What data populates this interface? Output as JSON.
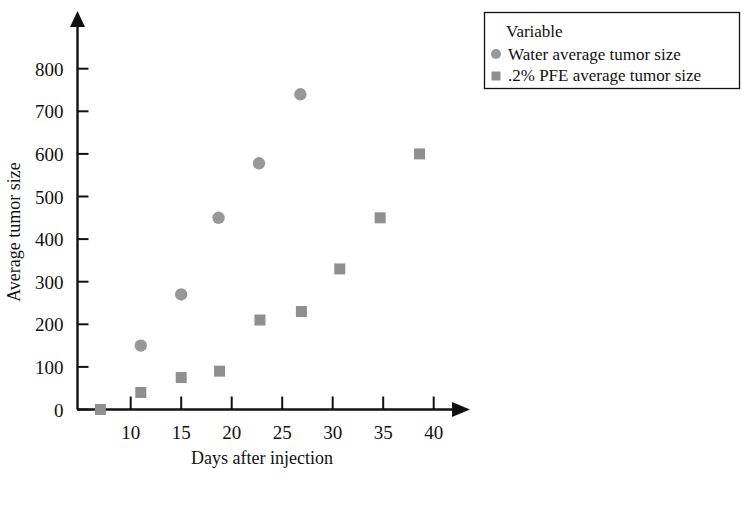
{
  "chart_data": {
    "type": "scatter",
    "title": "",
    "xlabel": "Days after injection",
    "ylabel": "Average tumor size",
    "xlim": [
      5,
      45
    ],
    "ylim": [
      0,
      800
    ],
    "xticks": [
      10,
      15,
      20,
      25,
      30,
      35,
      40
    ],
    "yticks": [
      0,
      100,
      200,
      300,
      400,
      500,
      600,
      700,
      800
    ],
    "grid": false,
    "legend_position": "top-right",
    "legend_title": "Variable",
    "series": [
      {
        "name": "Water average tumor size",
        "marker": "circle",
        "color": "#989898",
        "points": [
          {
            "x": 11,
            "y": 150
          },
          {
            "x": 15,
            "y": 270
          },
          {
            "x": 18.7,
            "y": 450
          },
          {
            "x": 22.7,
            "y": 578
          },
          {
            "x": 26.8,
            "y": 740
          }
        ]
      },
      {
        "name": ".2% PFE average tumor size",
        "marker": "square",
        "color": "#8f8f8f",
        "points": [
          {
            "x": 7,
            "y": 0
          },
          {
            "x": 11,
            "y": 40
          },
          {
            "x": 15,
            "y": 75
          },
          {
            "x": 18.8,
            "y": 90
          },
          {
            "x": 22.8,
            "y": 210
          },
          {
            "x": 26.9,
            "y": 230
          },
          {
            "x": 30.7,
            "y": 330
          },
          {
            "x": 34.7,
            "y": 450
          },
          {
            "x": 38.6,
            "y": 600
          }
        ]
      }
    ]
  },
  "axes": {
    "x_tick_labels": [
      "10",
      "15",
      "20",
      "25",
      "30",
      "35",
      "40"
    ],
    "y_tick_labels": [
      "0",
      "100",
      "200",
      "300",
      "400",
      "500",
      "600",
      "700",
      "800"
    ],
    "x_title": "Days after injection",
    "y_title": "Average tumor size"
  },
  "legend": {
    "title": "Variable",
    "entries": [
      {
        "label": "Water average tumor size",
        "marker": "circle-marker"
      },
      {
        "label": ".2% PFE average tumor size",
        "marker": "square-marker"
      }
    ]
  },
  "colors": {
    "marker_circle": "#989898",
    "marker_square": "#8f8f8f",
    "axis": "#111111",
    "text": "#111111",
    "background": "#ffffff"
  }
}
